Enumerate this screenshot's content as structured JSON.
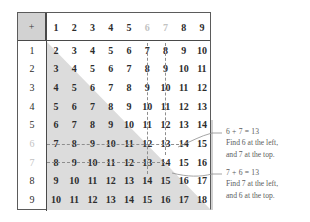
{
  "table": {
    "corner_label": "+",
    "col_headers": [
      "1",
      "2",
      "3",
      "4",
      "5",
      "6",
      "7",
      "8",
      "9"
    ],
    "row_headers": [
      "1",
      "2",
      "3",
      "4",
      "5",
      "6",
      "7",
      "8",
      "9"
    ],
    "highlighted_headers": [
      "6",
      "7"
    ],
    "rows": [
      [
        "2",
        "3",
        "4",
        "5",
        "6",
        "7",
        "8",
        "9",
        "10"
      ],
      [
        "3",
        "4",
        "5",
        "6",
        "7",
        "8",
        "9",
        "10",
        "11"
      ],
      [
        "4",
        "5",
        "6",
        "7",
        "8",
        "9",
        "10",
        "11",
        "12"
      ],
      [
        "5",
        "6",
        "7",
        "8",
        "9",
        "10",
        "11",
        "12",
        "13"
      ],
      [
        "6",
        "7",
        "8",
        "9",
        "10",
        "11",
        "12",
        "13",
        "14"
      ],
      [
        "7",
        "8",
        "9",
        "10",
        "11",
        "12",
        "13",
        "14",
        "15"
      ],
      [
        "8",
        "9",
        "10",
        "11",
        "12",
        "13",
        "14",
        "15",
        "16"
      ],
      [
        "9",
        "10",
        "11",
        "12",
        "13",
        "14",
        "15",
        "16",
        "17"
      ],
      [
        "10",
        "11",
        "12",
        "13",
        "14",
        "15",
        "16",
        "17",
        "18"
      ]
    ]
  },
  "callouts": [
    {
      "equation": "6 + 7 = 13",
      "line1": "Find 6 at the left,",
      "line2": "and 7 at the top."
    },
    {
      "equation": "7 + 6 = 13",
      "line1": "Find 7 at the left,",
      "line2": "and 6 at the top."
    }
  ],
  "colors": {
    "shade": "#dcdcdc",
    "corner_bg": "#d2d2d2",
    "border": "#5b5b5b",
    "text": "#2c2c2c",
    "dim_text": "#c2c2c2",
    "callout_text": "#5d5d5d",
    "guide": "#8e8e8e"
  }
}
